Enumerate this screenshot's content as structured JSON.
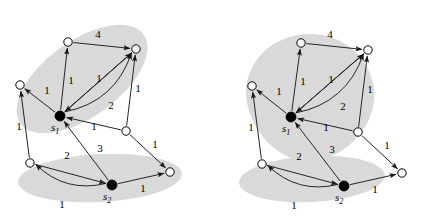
{
  "figure": {
    "type": "diagram",
    "background_color": "#ffffff",
    "shade_color": "#d9d9d9",
    "edge_color": "#1a1a1a",
    "node_fill_white": "#ffffff",
    "node_fill_black": "#000000",
    "node_stroke": "#000000"
  },
  "panels": [
    {
      "id": "left-panel",
      "name": "left-graph",
      "regions": [
        {
          "name": "upper-cluster-region",
          "shape": "ellipse",
          "cx": 82,
          "cy": 79,
          "rx": 76,
          "ry": 38,
          "rotate": -36
        },
        {
          "name": "lower-cluster-region",
          "shape": "ellipse",
          "cx": 100,
          "cy": 178,
          "rx": 82,
          "ry": 24,
          "rotate": -3
        }
      ],
      "nodes": [
        {
          "id": "n1",
          "name": "node-top-left",
          "x": 68,
          "y": 42,
          "type": "white",
          "label": ""
        },
        {
          "id": "n2",
          "name": "node-top-right",
          "x": 136,
          "y": 49,
          "type": "white",
          "label": ""
        },
        {
          "id": "n3",
          "name": "node-left-upper",
          "x": 20,
          "y": 85,
          "type": "white",
          "label": ""
        },
        {
          "id": "s1",
          "name": "node-s1",
          "x": 60,
          "y": 116,
          "type": "black",
          "label": "s",
          "sub": "1"
        },
        {
          "id": "n4",
          "name": "node-mid-right",
          "x": 126,
          "y": 131,
          "type": "white",
          "label": ""
        },
        {
          "id": "n5",
          "name": "node-left-lower",
          "x": 30,
          "y": 163,
          "type": "white",
          "label": ""
        },
        {
          "id": "s2",
          "name": "node-s2",
          "x": 112,
          "y": 185,
          "type": "black",
          "label": "s",
          "sub": "2"
        },
        {
          "id": "n6",
          "name": "node-bottom-right",
          "x": 170,
          "y": 172,
          "type": "white",
          "label": ""
        }
      ],
      "edges": [
        {
          "name": "edge-s1-n1",
          "from": "s1",
          "to": "n1",
          "weight": "1",
          "lx": 71,
          "ly": 84,
          "curve": 0
        },
        {
          "name": "edge-n1-n2",
          "from": "n1",
          "to": "n2",
          "weight": "4",
          "lx": 98,
          "ly": 38,
          "curve": 0
        },
        {
          "name": "edge-s1-n2-straight",
          "from": "s1",
          "to": "n2",
          "weight": "1",
          "lx": 99,
          "ly": 82,
          "curve": 0
        },
        {
          "name": "edge-s1-n2-curved",
          "from": "s1",
          "to": "n2",
          "weight": "2",
          "lx": 111,
          "ly": 109,
          "curve": 26
        },
        {
          "name": "edge-n2-s1",
          "from": "n2",
          "to": "s1",
          "weight": "",
          "lx": 0,
          "ly": 0,
          "curve": 0
        },
        {
          "name": "edge-s1-n3",
          "from": "s1",
          "to": "n3",
          "weight": "1",
          "lx": 47,
          "ly": 94,
          "curve": 0
        },
        {
          "name": "edge-n5-n3",
          "from": "n5",
          "to": "n3",
          "weight": "1",
          "lx": 19,
          "ly": 130,
          "curve": 0
        },
        {
          "name": "edge-n4-n2",
          "from": "n4",
          "to": "n2",
          "weight": "1",
          "lx": 138,
          "ly": 92,
          "curve": 0
        },
        {
          "name": "edge-n4-s1",
          "from": "n4",
          "to": "s1",
          "weight": "1",
          "lx": 94,
          "ly": 130,
          "curve": 0
        },
        {
          "name": "edge-n4-n6",
          "from": "n4",
          "to": "n6",
          "weight": "1",
          "lx": 155,
          "ly": 148,
          "curve": 0
        },
        {
          "name": "edge-s2-s1",
          "from": "s2",
          "to": "s1",
          "weight": "3",
          "lx": 100,
          "ly": 152,
          "curve": 0
        },
        {
          "name": "edge-n5-s2",
          "from": "n5",
          "to": "s2",
          "weight": "2",
          "lx": 67,
          "ly": 159,
          "curve": 0
        },
        {
          "name": "edge-s2-n5",
          "from": "s2",
          "to": "n5",
          "weight": "1",
          "lx": 62,
          "ly": 208,
          "curve": -20
        },
        {
          "name": "edge-s2-n6",
          "from": "s2",
          "to": "n6",
          "weight": "1",
          "lx": 143,
          "ly": 192,
          "curve": 0
        }
      ]
    },
    {
      "id": "right-panel",
      "name": "right-graph",
      "regions": [
        {
          "name": "upper-cluster-region",
          "shape": "blob",
          "cx": 308,
          "cy": 95,
          "rx": 66,
          "ry": 66,
          "rotate": -12
        },
        {
          "name": "lower-cluster-region",
          "shape": "ellipse",
          "cx": 312,
          "cy": 179,
          "rx": 73,
          "ry": 23,
          "rotate": -3
        }
      ],
      "nodes": [
        {
          "id": "n1",
          "name": "node-top-left",
          "x": 301,
          "y": 43,
          "type": "white",
          "label": ""
        },
        {
          "id": "n2",
          "name": "node-top-right",
          "x": 368,
          "y": 50,
          "type": "white",
          "label": ""
        },
        {
          "id": "n3",
          "name": "node-left-upper",
          "x": 252,
          "y": 86,
          "type": "white",
          "label": ""
        },
        {
          "id": "s1",
          "name": "node-s1",
          "x": 291,
          "y": 117,
          "type": "black",
          "label": "s",
          "sub": "1"
        },
        {
          "id": "n4",
          "name": "node-mid-right",
          "x": 358,
          "y": 132,
          "type": "white",
          "label": ""
        },
        {
          "id": "n5",
          "name": "node-left-lower",
          "x": 262,
          "y": 164,
          "type": "white",
          "label": ""
        },
        {
          "id": "s2",
          "name": "node-s2",
          "x": 344,
          "y": 186,
          "type": "black",
          "label": "s",
          "sub": "2"
        },
        {
          "id": "n6",
          "name": "node-bottom-right",
          "x": 402,
          "y": 173,
          "type": "white",
          "label": ""
        }
      ],
      "edges": [
        {
          "name": "edge-s1-n1",
          "from": "s1",
          "to": "n1",
          "weight": "1",
          "lx": 303,
          "ly": 85,
          "curve": 0
        },
        {
          "name": "edge-n1-n2",
          "from": "n1",
          "to": "n2",
          "weight": "4",
          "lx": 330,
          "ly": 38,
          "curve": 0
        },
        {
          "name": "edge-s1-n2-straight",
          "from": "s1",
          "to": "n2",
          "weight": "1",
          "lx": 331,
          "ly": 83,
          "curve": 0
        },
        {
          "name": "edge-s1-n2-curved",
          "from": "s1",
          "to": "n2",
          "weight": "2",
          "lx": 343,
          "ly": 110,
          "curve": 26
        },
        {
          "name": "edge-n2-s1",
          "from": "n2",
          "to": "s1",
          "weight": "",
          "lx": 0,
          "ly": 0,
          "curve": 0
        },
        {
          "name": "edge-s1-n3",
          "from": "s1",
          "to": "n3",
          "weight": "1",
          "lx": 279,
          "ly": 95,
          "curve": 0
        },
        {
          "name": "edge-n5-n3",
          "from": "n5",
          "to": "n3",
          "weight": "1",
          "lx": 251,
          "ly": 131,
          "curve": 0
        },
        {
          "name": "edge-n4-n2",
          "from": "n4",
          "to": "n2",
          "weight": "1",
          "lx": 370,
          "ly": 93,
          "curve": 0
        },
        {
          "name": "edge-n4-s1",
          "from": "n4",
          "to": "s1",
          "weight": "1",
          "lx": 326,
          "ly": 131,
          "curve": 0
        },
        {
          "name": "edge-n4-n6",
          "from": "n4",
          "to": "n6",
          "weight": "1",
          "lx": 387,
          "ly": 149,
          "curve": 0
        },
        {
          "name": "edge-s2-s1",
          "from": "s2",
          "to": "s1",
          "weight": "3",
          "lx": 332,
          "ly": 153,
          "curve": 0
        },
        {
          "name": "edge-n5-s2",
          "from": "n5",
          "to": "s2",
          "weight": "2",
          "lx": 299,
          "ly": 160,
          "curve": 0
        },
        {
          "name": "edge-s2-n5",
          "from": "s2",
          "to": "n5",
          "weight": "1",
          "lx": 294,
          "ly": 209,
          "curve": -20
        },
        {
          "name": "edge-s2-n6",
          "from": "s2",
          "to": "n6",
          "weight": "1",
          "lx": 375,
          "ly": 193,
          "curve": 0
        }
      ]
    }
  ]
}
